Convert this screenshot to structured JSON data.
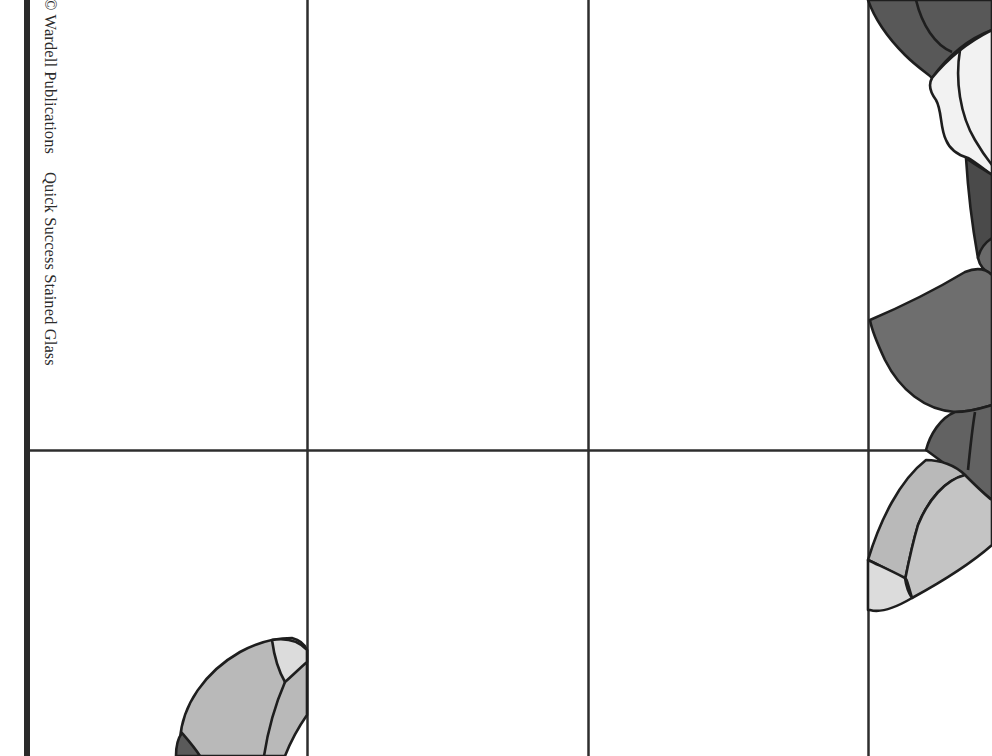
{
  "page": {
    "caption": {
      "copyright": "© Wardell Publications",
      "title": "Quick Success Stained Glass"
    },
    "grid": {
      "vertical_lines_x": [
        307,
        588,
        868
      ],
      "horizontal_line_y": 450,
      "line_color": "#2e2e2e"
    },
    "colors": {
      "background": "#ffffff",
      "spine": "#2a2a2a",
      "lead_line": "#1e1e1e",
      "dark_glass": "#585858",
      "medium_glass": "#6e6e6e",
      "light_glass": "#b9b9b9",
      "pale_glass": "#dcdcdc",
      "white_glass": "#f2f2f2"
    },
    "pattern": {
      "description": "Stained glass flower pattern tile (partial), split across grid panels"
    }
  }
}
